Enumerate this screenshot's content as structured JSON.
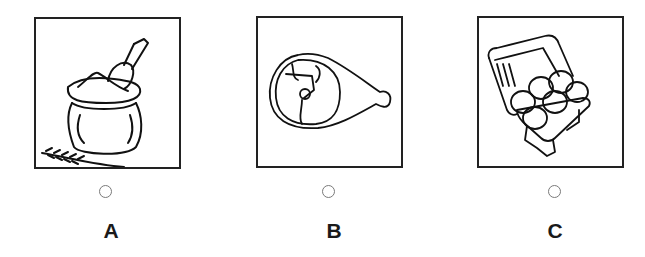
{
  "options": [
    {
      "letter": "A",
      "image": "flour-sack-with-scoop-and-wheat",
      "selected": false
    },
    {
      "letter": "B",
      "image": "ham-leg",
      "selected": false
    },
    {
      "letter": "C",
      "image": "egg-carton-six-eggs",
      "selected": false
    }
  ]
}
